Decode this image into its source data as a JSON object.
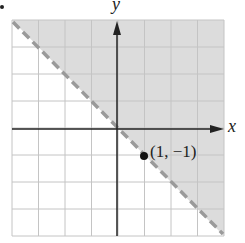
{
  "chart_data": {
    "type": "line",
    "title": "",
    "xlabel": "x",
    "ylabel": "y",
    "xlim": [
      -4,
      4
    ],
    "ylim": [
      -4,
      4
    ],
    "grid": true,
    "grid_step": 1,
    "boundary": {
      "equation": "y = -x",
      "style": "dashed",
      "color": "#9a9a9a",
      "x": [
        -4,
        4
      ],
      "y": [
        4,
        -4
      ]
    },
    "shaded_region": {
      "description": "half-plane above the line y = -x",
      "inequality": "y > -x",
      "color": "#dcdcdc"
    },
    "points": [
      {
        "x": 1,
        "y": -1,
        "label": "(1, −1)"
      }
    ],
    "legend": null
  },
  "labels": {
    "x_axis": "x",
    "y_axis": "y",
    "point": "(1, −1)"
  },
  "colors": {
    "shade": "#dcdcdc",
    "grid": "#c4c4c4",
    "axis": "#222222",
    "boundary": "#9a9a9a",
    "point": "#111111"
  }
}
